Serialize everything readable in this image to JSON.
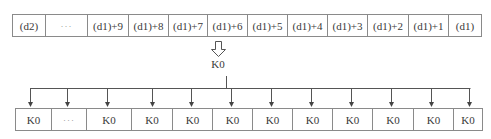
{
  "diagram": {
    "source_row": {
      "cells": [
        "(d2)",
        "···",
        "(d1)+9",
        "(d1)+8",
        "(d1)+7",
        "(d1)+6",
        "(d1)+5",
        "(d1)+4",
        "(d1)+3",
        "(d1)+2",
        "(d1)+1",
        "(d1)"
      ],
      "widths": [
        33,
        42,
        41,
        40,
        39,
        40,
        40,
        40,
        40,
        41,
        40,
        34
      ]
    },
    "transfer_arrow": "hollow-down-arrow",
    "constant_label": "K0",
    "target_row": {
      "cells": [
        "K0",
        "···",
        "K0",
        "K0",
        "K0",
        "K0",
        "K0",
        "K0",
        "K0",
        "K0",
        "K0",
        "K0"
      ],
      "widths": [
        36,
        35,
        45,
        41,
        40,
        40,
        40,
        40,
        40,
        41,
        40,
        30
      ]
    },
    "colors": {
      "line": "#8a8a8a",
      "arrow": "#555555",
      "text": "#3a3a3a"
    }
  }
}
